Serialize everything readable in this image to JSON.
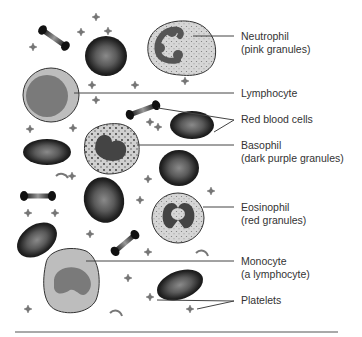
{
  "diagram": {
    "type": "labeled illustration",
    "subject": "blood cells",
    "labels": [
      {
        "id": "neutrophil",
        "line1": "Neutrophil",
        "line2": "(pink granules)"
      },
      {
        "id": "lymphocyte",
        "line1": "Lymphocyte"
      },
      {
        "id": "red-blood-cells",
        "line1": "Red blood cells"
      },
      {
        "id": "basophil",
        "line1": "Basophil",
        "line2": "(dark purple granules)"
      },
      {
        "id": "eosinophil",
        "line1": "Eosinophil",
        "line2": "(red granules)"
      },
      {
        "id": "monocyte",
        "line1": "Monocyte",
        "line2": "(a lymphocyte)"
      },
      {
        "id": "platelets",
        "line1": "Platelets"
      }
    ]
  }
}
